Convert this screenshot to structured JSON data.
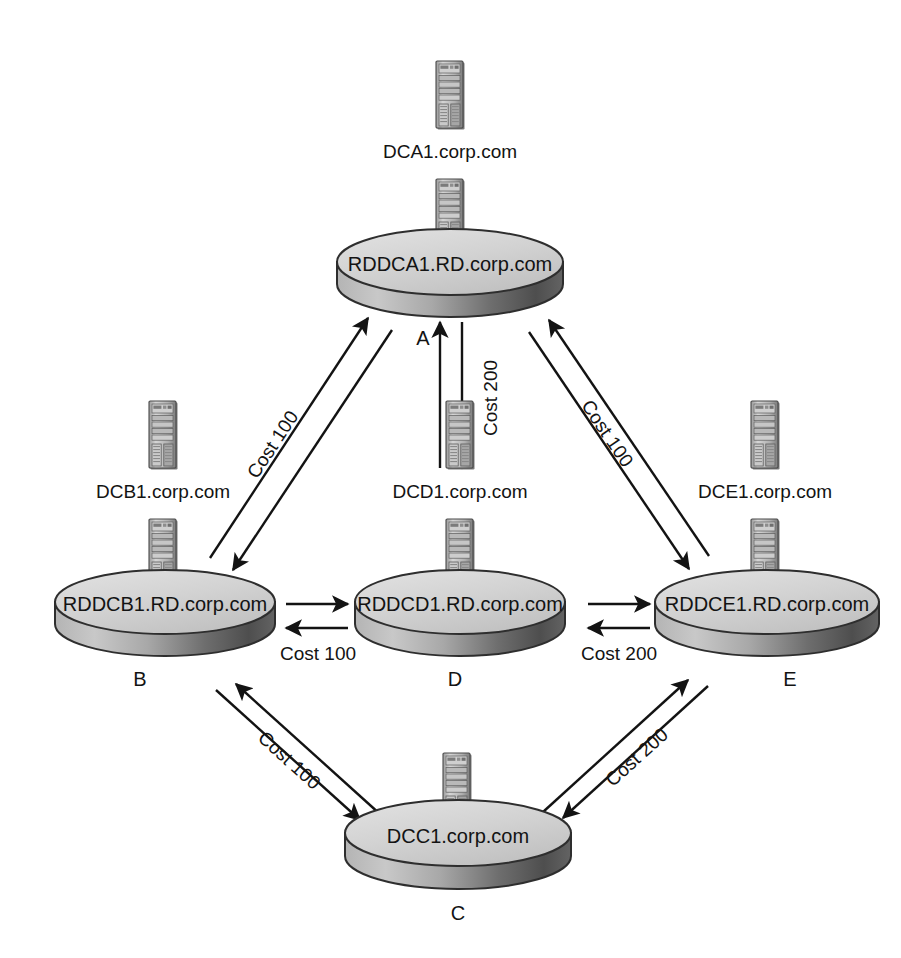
{
  "diagram": {
    "type": "network-topology",
    "background_color": "#ffffff",
    "line_color": "#131313",
    "cylinder_top_color": "#d8d8d8",
    "cylinder_body_light": "#bdbdbd",
    "cylinder_body_dark": "#5a5a5a"
  },
  "sites": [
    {
      "id": "A",
      "letter": "A",
      "cylinder_label": "RDDCA1.RD.corp.com",
      "server_label": "DCA1.corp.com",
      "server_icon": "server-tower-icon",
      "cx": 450,
      "cy": 268
    },
    {
      "id": "B",
      "letter": "B",
      "cylinder_label": "RDDCB1.RD.corp.com",
      "server_label": "DCB1.corp.com",
      "server_icon": "server-tower-icon",
      "cx": 165,
      "cy": 608
    },
    {
      "id": "D",
      "letter": "D",
      "cylinder_label": "RDDCD1.RD.corp.com",
      "server_label": "DCD1.corp.com",
      "server_icon": "server-tower-icon",
      "cx": 460,
      "cy": 608
    },
    {
      "id": "E",
      "letter": "E",
      "cylinder_label": "RDDCE1.RD.corp.com",
      "server_label": "DCE1.corp.com",
      "server_icon": "server-tower-icon",
      "cx": 767,
      "cy": 608
    },
    {
      "id": "C",
      "letter": "C",
      "cylinder_label": "DCC1.corp.com",
      "server_label": "",
      "server_icon": "server-tower-icon",
      "cx": 458,
      "cy": 838
    }
  ],
  "links": [
    {
      "id": "A-B",
      "from": "A",
      "to": "B",
      "cost_label": "Cost 100",
      "cost": 100,
      "bidirectional": true,
      "orientation": "diagonal-down-left"
    },
    {
      "id": "A-D",
      "from": "A",
      "to": "D",
      "cost_label": "Cost 200",
      "cost": 200,
      "bidirectional": true,
      "orientation": "vertical"
    },
    {
      "id": "A-E",
      "from": "A",
      "to": "E",
      "cost_label": "Cost 100",
      "cost": 100,
      "bidirectional": true,
      "orientation": "diagonal-down-right"
    },
    {
      "id": "B-D",
      "from": "B",
      "to": "D",
      "cost_label": "Cost 100",
      "cost": 100,
      "bidirectional": true,
      "orientation": "horizontal"
    },
    {
      "id": "D-E",
      "from": "D",
      "to": "E",
      "cost_label": "Cost 200",
      "cost": 200,
      "bidirectional": true,
      "orientation": "horizontal"
    },
    {
      "id": "B-C",
      "from": "B",
      "to": "C",
      "cost_label": "Cost 100",
      "cost": 100,
      "bidirectional": true,
      "orientation": "diagonal-down-right"
    },
    {
      "id": "C-E",
      "from": "C",
      "to": "E",
      "cost_label": "Cost 200",
      "cost": 200,
      "bidirectional": true,
      "orientation": "diagonal-up-right"
    }
  ]
}
